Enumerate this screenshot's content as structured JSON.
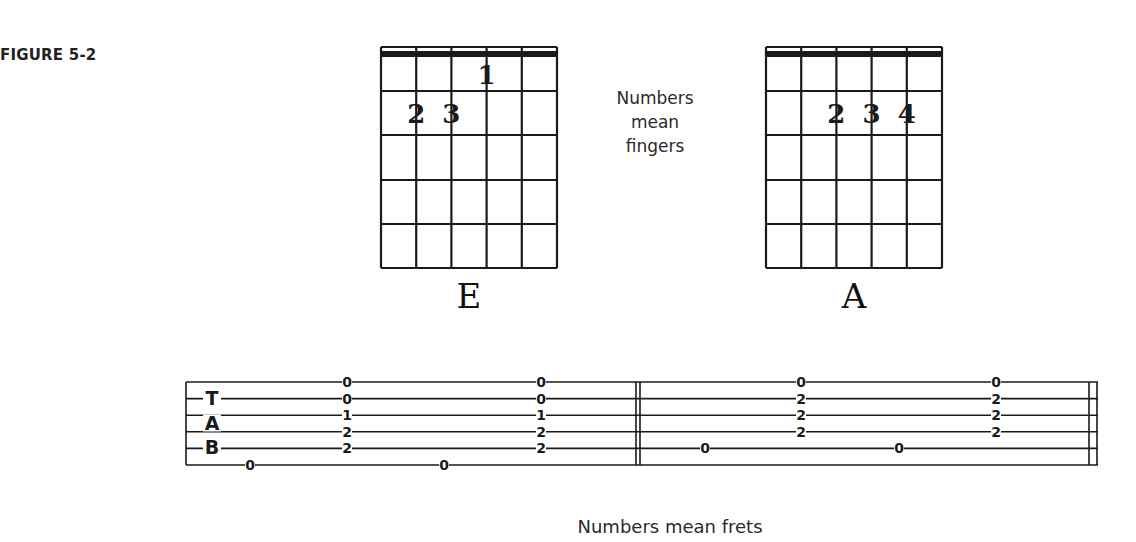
{
  "figure": {
    "label": "FIGURE 5-2",
    "fingers_caption": [
      "Numbers",
      "mean",
      "fingers"
    ],
    "frets_caption": "Numbers mean frets"
  },
  "chords": [
    {
      "name": "E",
      "strings": 6,
      "frets_shown": 5,
      "fingerings": [
        {
          "finger": "1",
          "string": 4,
          "fret": 1
        },
        {
          "finger": "2",
          "string": 2,
          "fret": 2
        },
        {
          "finger": "3",
          "string": 3,
          "fret": 2
        }
      ]
    },
    {
      "name": "A",
      "strings": 6,
      "frets_shown": 5,
      "fingerings": [
        {
          "finger": "2",
          "string": 3,
          "fret": 2
        },
        {
          "finger": "3",
          "string": 4,
          "fret": 2
        },
        {
          "finger": "4",
          "string": 5,
          "fret": 2
        }
      ]
    }
  ],
  "tab": {
    "clef_letters": [
      "T",
      "A",
      "B"
    ],
    "lines": 6,
    "measures": [
      {
        "events": [
          {
            "x": 250,
            "notes": [
              {
                "line": 6,
                "fret": "0"
              }
            ]
          },
          {
            "x": 347,
            "notes": [
              {
                "line": 1,
                "fret": "0"
              },
              {
                "line": 2,
                "fret": "0"
              },
              {
                "line": 3,
                "fret": "1"
              },
              {
                "line": 4,
                "fret": "2"
              },
              {
                "line": 5,
                "fret": "2"
              }
            ]
          },
          {
            "x": 444,
            "notes": [
              {
                "line": 6,
                "fret": "0"
              }
            ]
          },
          {
            "x": 541,
            "notes": [
              {
                "line": 1,
                "fret": "0"
              },
              {
                "line": 2,
                "fret": "0"
              },
              {
                "line": 3,
                "fret": "1"
              },
              {
                "line": 4,
                "fret": "2"
              },
              {
                "line": 5,
                "fret": "2"
              }
            ]
          }
        ]
      },
      {
        "events": [
          {
            "x": 705,
            "notes": [
              {
                "line": 5,
                "fret": "0"
              }
            ]
          },
          {
            "x": 801,
            "notes": [
              {
                "line": 1,
                "fret": "0"
              },
              {
                "line": 2,
                "fret": "2"
              },
              {
                "line": 3,
                "fret": "2"
              },
              {
                "line": 4,
                "fret": "2"
              }
            ]
          },
          {
            "x": 899,
            "notes": [
              {
                "line": 5,
                "fret": "0"
              }
            ]
          },
          {
            "x": 996,
            "notes": [
              {
                "line": 1,
                "fret": "0"
              },
              {
                "line": 2,
                "fret": "2"
              },
              {
                "line": 3,
                "fret": "2"
              },
              {
                "line": 4,
                "fret": "2"
              }
            ]
          }
        ]
      }
    ]
  }
}
